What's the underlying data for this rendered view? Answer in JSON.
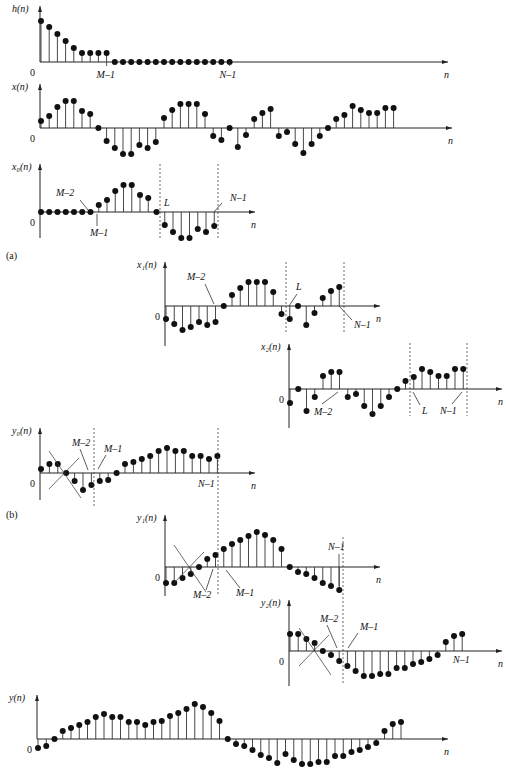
{
  "figure_labels": {
    "a": "(a)",
    "b": "(b)"
  },
  "chart_data": [
    {
      "id": "h",
      "type": "stem",
      "ylabel": "h(n)",
      "xlabel": "n",
      "origin": "0",
      "values": [
        41,
        35,
        28,
        21,
        14,
        9,
        9,
        9,
        9,
        0,
        0,
        0,
        0,
        0,
        0,
        0,
        0,
        0,
        0,
        0,
        0,
        0,
        0,
        0
      ],
      "tick_labels": [
        {
          "text": "M–1",
          "index": 8
        },
        {
          "text": "N–1",
          "index": 23
        }
      ]
    },
    {
      "id": "x",
      "type": "stem",
      "ylabel": "x(n)",
      "xlabel": "n",
      "origin": "0",
      "values": [
        7,
        12,
        21,
        27,
        27,
        17,
        14,
        0,
        -13,
        -20,
        -26,
        -26,
        -17,
        -20,
        -14,
        10,
        18,
        24,
        24,
        24,
        14,
        -8,
        -12,
        0,
        -19,
        -7,
        9,
        15,
        19,
        -8,
        -4,
        -16,
        -25,
        -16,
        -8,
        0,
        9,
        13,
        22,
        18,
        15,
        15,
        20,
        20
      ]
    },
    {
      "id": "x0",
      "type": "stem",
      "ylabel": "x₀(n)",
      "xlabel": "n",
      "origin": "0",
      "values": [
        0,
        0,
        0,
        0,
        0,
        0,
        0,
        7,
        12,
        21,
        27,
        27,
        17,
        14,
        0,
        -13,
        -20,
        -26,
        -26,
        -17,
        -20,
        -14
      ],
      "annotations": [
        {
          "text": "M–2"
        },
        {
          "text": "M–1"
        },
        {
          "text": "L"
        },
        {
          "text": "N–1"
        }
      ]
    },
    {
      "id": "x1",
      "type": "stem",
      "ylabel": "x₁(n)",
      "xlabel": "n",
      "origin": "0",
      "values": [
        -13,
        -18,
        -24,
        -21,
        -16,
        -19,
        -16,
        0,
        11,
        18,
        24,
        24,
        24,
        14,
        -8,
        -13,
        0,
        -19,
        -7,
        8,
        15,
        19
      ],
      "annotations": [
        {
          "text": "M–2"
        },
        {
          "text": "L"
        },
        {
          "text": "N–1"
        }
      ]
    },
    {
      "id": "x2",
      "type": "stem",
      "ylabel": "x₂(n)",
      "xlabel": "n",
      "origin": "0",
      "values": [
        -14,
        0,
        -22,
        -8,
        13,
        17,
        17,
        -8,
        -5,
        -17,
        -25,
        -17,
        -8,
        0,
        8,
        12,
        20,
        17,
        13,
        13,
        20,
        20
      ],
      "annotations": [
        {
          "text": "M–2"
        },
        {
          "text": "L"
        },
        {
          "text": "N–1"
        }
      ]
    },
    {
      "id": "y0",
      "type": "stem",
      "ylabel": "y₀(n)",
      "xlabel": "n",
      "origin": "0",
      "values": [
        4,
        9,
        9,
        0,
        -8,
        -17,
        -12,
        -8,
        -7,
        0,
        9,
        11,
        14,
        17,
        22,
        25,
        22,
        22,
        17,
        17,
        14,
        17
      ],
      "annotations": [
        {
          "text": "M–2"
        },
        {
          "text": "M–1"
        },
        {
          "text": "N–1"
        }
      ]
    },
    {
      "id": "y1",
      "type": "stem",
      "ylabel": "y₁(n)",
      "xlabel": "n",
      "origin": "0",
      "values": [
        -16,
        -16,
        -11,
        -7,
        0,
        8,
        12,
        18,
        23,
        27,
        31,
        35,
        32,
        27,
        18,
        0,
        -5,
        -7,
        -11,
        -16,
        -19,
        -23
      ],
      "annotations": [
        {
          "text": "M–2"
        },
        {
          "text": "M–1"
        },
        {
          "text": "N–1"
        }
      ]
    },
    {
      "id": "y2",
      "type": "stem",
      "ylabel": "y₂(n)",
      "xlabel": "n",
      "origin": "0",
      "values": [
        17,
        17,
        12,
        8,
        0,
        -4,
        -10,
        -15,
        -20,
        -25,
        -25,
        -23,
        -23,
        -17,
        -17,
        -13,
        -11,
        -8,
        -4,
        9,
        15,
        17
      ],
      "annotations": [
        {
          "text": "M–2"
        },
        {
          "text": "M–1"
        },
        {
          "text": "N–1"
        }
      ]
    },
    {
      "id": "y",
      "type": "stem",
      "ylabel": "y(n)",
      "xlabel": "n",
      "origin": "0",
      "values": [
        -9,
        -7,
        0,
        8,
        11,
        14,
        17,
        22,
        25,
        22,
        22,
        17,
        17,
        14,
        17,
        18,
        23,
        26,
        30,
        35,
        32,
        26,
        18,
        0,
        -5,
        -7,
        -11,
        -16,
        -19,
        -24,
        -15,
        -21,
        -25,
        -25,
        -23,
        -23,
        -17,
        -17,
        -13,
        -11,
        -8,
        -4,
        8,
        15,
        17
      ]
    }
  ]
}
